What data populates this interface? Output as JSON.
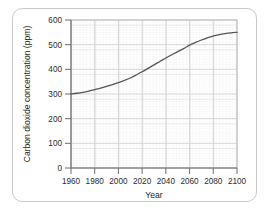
{
  "figure": {
    "frame_color": "#c9c9c9",
    "background": "#ffffff"
  },
  "chart_data": {
    "type": "line",
    "title": "",
    "subtitle": "",
    "xlabel": "Year",
    "ylabel": "Carbon dioxide concentration (ppm)",
    "xlim": [
      1960,
      2100
    ],
    "ylim": [
      0,
      600
    ],
    "xticks": [
      1960,
      1980,
      2000,
      2020,
      2040,
      2060,
      2080,
      2100
    ],
    "xtick_labels": [
      "1960",
      "1980",
      "2000",
      "2020",
      "2040",
      "2060",
      "2080",
      "2100"
    ],
    "yticks": [
      0,
      100,
      200,
      300,
      400,
      500,
      600
    ],
    "ytick_labels": [
      "0",
      "100",
      "200",
      "300",
      "400",
      "500",
      "600"
    ],
    "grid": true,
    "major_grid": true,
    "minor_grid": true,
    "major_grid_color": "#d8d8d8",
    "minor_grid_color": "#ececec",
    "legend": false,
    "legend_position": "none",
    "line_color": "#555555",
    "line_width": 1.3,
    "markers": false,
    "annotations": [],
    "series": [
      {
        "name": "Carbon dioxide concentration",
        "x": [
          1960,
          1965,
          1970,
          1975,
          1980,
          1985,
          1990,
          1995,
          2000,
          2005,
          2010,
          2015,
          2020,
          2025,
          2030,
          2035,
          2040,
          2045,
          2050,
          2055,
          2060,
          2065,
          2070,
          2075,
          2080,
          2085,
          2090,
          2095,
          2100
        ],
        "values": [
          300,
          303,
          307,
          312,
          318,
          324,
          331,
          338,
          346,
          355,
          365,
          377,
          390,
          404,
          418,
          432,
          446,
          459,
          472,
          484,
          498,
          509,
          519,
          528,
          535,
          541,
          545,
          548,
          550
        ]
      }
    ]
  },
  "axis_labels": {
    "y_title": "Carbon dioxide concentration (ppm)",
    "x_title": "Year"
  }
}
